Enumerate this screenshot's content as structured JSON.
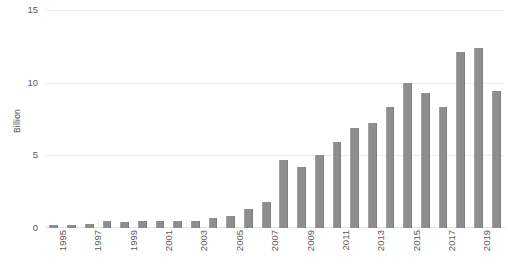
{
  "chart_data": {
    "type": "bar",
    "title": "",
    "subtitle": "",
    "xlabel": "",
    "ylabel": "Billion",
    "ylim": [
      0,
      15
    ],
    "yticks": [
      0,
      5,
      10,
      15
    ],
    "ytick_labels": [
      "0",
      "5",
      "10",
      "15"
    ],
    "grid": true,
    "legend": false,
    "legend_position": "none",
    "annotations": [],
    "bar_color": "#8e8e8e",
    "gridline_color": "#ededed",
    "axis_text_color": "#5a5a5a",
    "background_color": "#ffffff",
    "categories": [
      "1995",
      "1996",
      "1997",
      "1998",
      "1999",
      "2000",
      "2001",
      "2002",
      "2003",
      "2004",
      "2005",
      "2006",
      "2007",
      "2008",
      "2009",
      "2010",
      "2011",
      "2012",
      "2013",
      "2014",
      "2015",
      "2016",
      "2017",
      "2018",
      "2019",
      "2020"
    ],
    "values": [
      0.2,
      0.2,
      0.25,
      0.45,
      0.4,
      0.45,
      0.45,
      0.5,
      0.5,
      0.7,
      0.8,
      1.3,
      1.8,
      4.7,
      4.2,
      5.0,
      5.9,
      6.9,
      7.2,
      8.3,
      10.0,
      9.3,
      8.3,
      12.1,
      12.4,
      9.4
    ],
    "visible_xtick_labels": [
      "1995",
      "1997",
      "1999",
      "2001",
      "2003",
      "2005",
      "2007",
      "2009",
      "2011",
      "2013",
      "2015",
      "2017",
      "2019"
    ],
    "xtick_label_interval": 2
  }
}
